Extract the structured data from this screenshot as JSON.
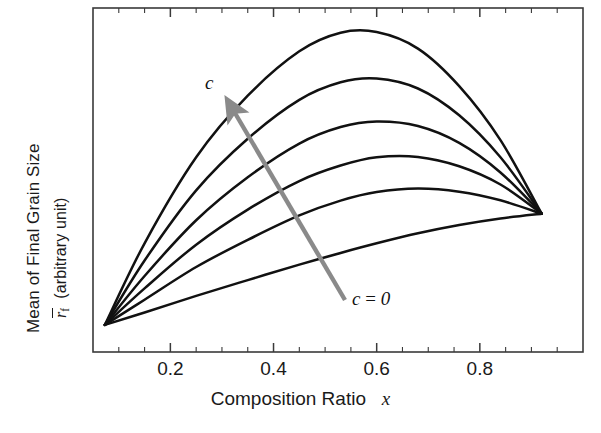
{
  "figure": {
    "kind": "line-plot",
    "background": "#ffffff",
    "frame_color": "#3a3a3a",
    "curve_color": "#111111",
    "arrow_color": "#8a8a8a"
  },
  "axes": {
    "x": {
      "label_text": "Composition Ratio",
      "label_symbol": "x",
      "tick_labels": [
        "0.2",
        "0.4",
        "0.6",
        "0.8"
      ],
      "tick_values": [
        0.2,
        0.4,
        0.6,
        0.8
      ],
      "minor_ticks_per_major": 2,
      "range": [
        0.05,
        1.0
      ]
    },
    "y": {
      "label_line1": "Mean of Final Grain Size",
      "label_symbol": "r",
      "label_subscript": "f",
      "label_units": "(arbitrary unit)",
      "tick_labels": [],
      "range": [
        0,
        1
      ]
    }
  },
  "annotations": [
    {
      "name": "arrow-label-c",
      "text": "c",
      "x_px": 205,
      "y_px": 72
    },
    {
      "name": "arrow-label-c-zero",
      "text": "c = 0",
      "lhs": "c",
      "eq": "=",
      "rhs": "0",
      "x_px": 352,
      "y_px": 288
    }
  ],
  "arrow": {
    "name": "trend-arrow",
    "meaning": "direction of increasing c",
    "tail_px": [
      345,
      300
    ],
    "tip_px": [
      228,
      103
    ],
    "color": "#8a8a8a"
  },
  "chart_data": {
    "type": "line",
    "title": "",
    "xlabel": "Composition Ratio  x",
    "ylabel": "Mean of Final Grain Size  r̄_f (arbitrary unit)",
    "xlim": [
      0.05,
      1.0
    ],
    "ylim": [
      0,
      1
    ],
    "grid": false,
    "legend": "none",
    "x_tick_values": [
      0.2,
      0.4,
      0.6,
      0.8
    ],
    "x_tick_labels": [
      "0.2",
      "0.4",
      "0.6",
      "0.8"
    ],
    "note": "Six curves for increasing parameter c; all curves share the same left endpoint (x=0.073) and right endpoint (x=0.92). Larger c gives a taller interior maximum. y values are in arbitrary units normalised to the plot frame.",
    "shared_endpoints": {
      "left": {
        "x": 0.073,
        "y": 0.079
      },
      "right": {
        "x": 0.92,
        "y": 0.402
      }
    },
    "x": [
      0.073,
      0.15,
      0.25,
      0.35,
      0.45,
      0.53,
      0.6,
      0.68,
      0.76,
      0.84,
      0.92
    ],
    "series": [
      {
        "name": "c = 0",
        "c": 0,
        "peak": {
          "x": 0.92,
          "y": 0.402
        },
        "values": [
          0.079,
          0.115,
          0.163,
          0.209,
          0.254,
          0.288,
          0.316,
          0.345,
          0.369,
          0.388,
          0.402
        ]
      },
      {
        "name": "c = 1",
        "c": 1,
        "peak": {
          "x": 0.63,
          "y": 0.475
        },
        "values": [
          0.079,
          0.152,
          0.247,
          0.326,
          0.397,
          0.44,
          0.465,
          0.475,
          0.466,
          0.441,
          0.402
        ]
      },
      {
        "name": "c = 2",
        "c": 2,
        "peak": {
          "x": 0.6,
          "y": 0.567
        },
        "values": [
          0.079,
          0.185,
          0.312,
          0.414,
          0.497,
          0.542,
          0.566,
          0.567,
          0.54,
          0.487,
          0.402
        ]
      },
      {
        "name": "c = 3",
        "c": 3,
        "peak": {
          "x": 0.57,
          "y": 0.67
        },
        "values": [
          0.079,
          0.221,
          0.383,
          0.508,
          0.606,
          0.654,
          0.67,
          0.657,
          0.608,
          0.522,
          0.402
        ]
      },
      {
        "name": "c = 4",
        "c": 4,
        "peak": {
          "x": 0.55,
          "y": 0.796
        },
        "values": [
          0.079,
          0.266,
          0.47,
          0.62,
          0.733,
          0.784,
          0.795,
          0.766,
          0.688,
          0.566,
          0.402
        ]
      },
      {
        "name": "c = 5",
        "c": 5,
        "peak": {
          "x": 0.53,
          "y": 0.93
        },
        "values": [
          0.079,
          0.316,
          0.566,
          0.745,
          0.874,
          0.928,
          0.93,
          0.882,
          0.773,
          0.616,
          0.402
        ]
      }
    ]
  }
}
